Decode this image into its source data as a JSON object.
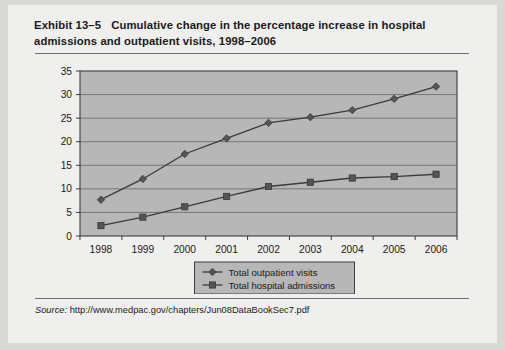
{
  "exhibit": {
    "number": "Exhibit 13–5",
    "title": "Cumulative change in the percentage increase in hospital admissions and outpatient visits, 1998–2006"
  },
  "source": {
    "label": "Source:",
    "url": "http://www.medpac.gov/chapters/Jun08DataBookSec7.pdf"
  },
  "colors": {
    "page_background": "#efefed",
    "outer_background": "#d8d8d6",
    "plot_background": "#b7b7b7",
    "plot_border": "#3c3c3c",
    "gridline": "#6f6f6f",
    "series_line": "#3a3a3a",
    "marker_fill": "#555555",
    "text": "#1a1a1a"
  },
  "chart_data": {
    "type": "line",
    "title": "Cumulative change in the percentage increase in hospital admissions and outpatient visits, 1998–2006",
    "xlabel": "",
    "ylabel": "",
    "categories": [
      "1998",
      "1999",
      "2000",
      "2001",
      "2002",
      "2003",
      "2004",
      "2005",
      "2006"
    ],
    "ylim": [
      0,
      35
    ],
    "yticks": [
      0,
      5,
      10,
      15,
      20,
      25,
      30,
      35
    ],
    "ytick_labels": [
      "0",
      "5",
      "10",
      "15",
      "20",
      "25",
      "30",
      "35"
    ],
    "grid": true,
    "grid_axis": "y",
    "legend_position": "bottom-center",
    "series": [
      {
        "name": "Total outpatient visits",
        "marker": "diamond",
        "values": [
          7.7,
          12.1,
          17.4,
          20.7,
          24.0,
          25.2,
          26.7,
          29.1,
          31.7
        ]
      },
      {
        "name": "Total hospital admissions",
        "marker": "square",
        "values": [
          2.2,
          4.0,
          6.2,
          8.4,
          10.5,
          11.4,
          12.3,
          12.6,
          13.1
        ]
      }
    ]
  }
}
